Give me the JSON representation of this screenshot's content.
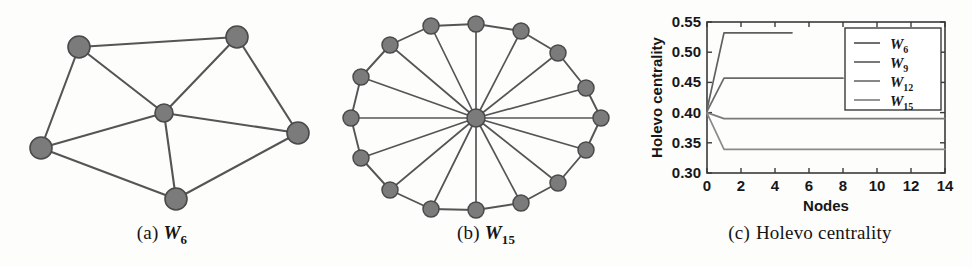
{
  "figure": {
    "panels": [
      {
        "id": "a",
        "caption_tag": "(a)",
        "caption_math": "W",
        "caption_sub": "6",
        "caption_text": "",
        "graph_name": "wheel-graph-w6"
      },
      {
        "id": "b",
        "caption_tag": "(b)",
        "caption_math": "W",
        "caption_sub": "15",
        "caption_text": "",
        "graph_name": "wheel-graph-w15"
      },
      {
        "id": "c",
        "caption_tag": "(c)",
        "caption_math": "",
        "caption_sub": "",
        "caption_text": "Holevo centrality",
        "graph_name": "holevo-centrality-chart"
      }
    ]
  },
  "colors": {
    "node_fill": "#7b7b7b",
    "node_stroke": "#4a4a4a",
    "edge": "#555555",
    "axis": "#3a3a3a",
    "line_w6": "#5f5f5f",
    "line_w9": "#6a6a6a",
    "line_w12": "#7a7a7a",
    "line_w15": "#8a8a8a",
    "background": "#fdfdfc"
  },
  "graph_w6": {
    "label": "W6",
    "node_count": 6,
    "nodes": [
      {
        "id": "n1",
        "x": 79,
        "y": 47,
        "r": 11,
        "role": "rim"
      },
      {
        "id": "n2",
        "x": 237,
        "y": 37,
        "r": 11,
        "role": "rim"
      },
      {
        "id": "n3",
        "x": 298,
        "y": 133,
        "r": 11,
        "role": "rim"
      },
      {
        "id": "n4",
        "x": 176,
        "y": 199,
        "r": 11,
        "role": "rim"
      },
      {
        "id": "n5",
        "x": 41,
        "y": 148,
        "r": 11,
        "role": "rim"
      },
      {
        "id": "hub",
        "x": 164,
        "y": 113,
        "r": 9,
        "role": "hub"
      }
    ],
    "edges": [
      [
        "n1",
        "n2"
      ],
      [
        "n2",
        "n3"
      ],
      [
        "n3",
        "n4"
      ],
      [
        "n4",
        "n5"
      ],
      [
        "n5",
        "n1"
      ],
      [
        "hub",
        "n1"
      ],
      [
        "hub",
        "n2"
      ],
      [
        "hub",
        "n3"
      ],
      [
        "hub",
        "n4"
      ],
      [
        "hub",
        "n5"
      ]
    ]
  },
  "graph_w15": {
    "label": "W15",
    "node_count": 15,
    "rim_count": 14,
    "center": {
      "x": 152,
      "y": 118,
      "r": 9
    },
    "radius_x": 125,
    "radius_y": 93,
    "rim_radius": 8,
    "start_angle_deg": 180,
    "nodes": [
      {
        "id": "r0",
        "x": 27,
        "y": 118
      },
      {
        "id": "r1",
        "x": 37,
        "y": 77
      },
      {
        "id": "r2",
        "x": 66,
        "y": 45
      },
      {
        "id": "r3",
        "x": 107,
        "y": 26
      },
      {
        "id": "r4",
        "x": 152,
        "y": 24
      },
      {
        "id": "r5",
        "x": 197,
        "y": 31
      },
      {
        "id": "r6",
        "x": 234,
        "y": 53
      },
      {
        "id": "r7",
        "x": 262,
        "y": 88
      },
      {
        "id": "r8",
        "x": 277,
        "y": 118
      },
      {
        "id": "r9",
        "x": 262,
        "y": 150
      },
      {
        "id": "r10",
        "x": 234,
        "y": 183
      },
      {
        "id": "r11",
        "x": 197,
        "y": 203
      },
      {
        "id": "r12",
        "x": 152,
        "y": 210
      },
      {
        "id": "r13",
        "x": 107,
        "y": 209
      },
      {
        "id": "r14",
        "x": 66,
        "y": 190
      },
      {
        "id": "r15",
        "x": 37,
        "y": 158
      }
    ]
  },
  "chart_data": {
    "type": "line",
    "title": "",
    "xlabel": "Nodes",
    "ylabel": "Holevo centrality",
    "xlim": [
      0,
      14
    ],
    "ylim": [
      0.3,
      0.55
    ],
    "xticks": [
      0,
      2,
      4,
      6,
      8,
      10,
      12,
      14
    ],
    "xtick_labels": [
      "0",
      "2",
      "4",
      "6",
      "8",
      "10",
      "12",
      "14"
    ],
    "yticks": [
      0.3,
      0.35,
      0.4,
      0.45,
      0.5,
      0.55
    ],
    "ytick_labels": [
      "0.30",
      "0.35",
      "0.40",
      "0.45",
      "0.50",
      "0.55"
    ],
    "grid": false,
    "legend_position": "upper right",
    "legend_entries": [
      {
        "label": "W",
        "sub": "6",
        "color": "#5f5f5f"
      },
      {
        "label": "W",
        "sub": "9",
        "color": "#6a6a6a"
      },
      {
        "label": "W",
        "sub": "12",
        "color": "#7a7a7a"
      },
      {
        "label": "W",
        "sub": "15",
        "color": "#8a8a8a"
      }
    ],
    "series": [
      {
        "name": "W6",
        "color": "#5f5f5f",
        "x": [
          0,
          1,
          2,
          3,
          4,
          5
        ],
        "values": [
          0.405,
          0.532,
          0.532,
          0.532,
          0.532,
          0.532
        ]
      },
      {
        "name": "W9",
        "color": "#6a6a6a",
        "x": [
          0,
          1,
          2,
          3,
          4,
          5,
          6,
          7,
          8
        ],
        "values": [
          0.402,
          0.457,
          0.457,
          0.457,
          0.457,
          0.457,
          0.457,
          0.457,
          0.457
        ]
      },
      {
        "name": "W12",
        "color": "#7a7a7a",
        "x": [
          0,
          1,
          2,
          3,
          4,
          5,
          6,
          7,
          8,
          9,
          10,
          11,
          12,
          13,
          14
        ],
        "values": [
          0.4,
          0.39,
          0.39,
          0.39,
          0.39,
          0.39,
          0.39,
          0.39,
          0.39,
          0.39,
          0.39,
          0.39,
          0.39,
          0.39,
          0.39
        ]
      },
      {
        "name": "W15",
        "color": "#8a8a8a",
        "x": [
          0,
          1,
          2,
          3,
          4,
          5,
          6,
          7,
          8,
          9,
          10,
          11,
          12,
          13,
          14
        ],
        "values": [
          0.399,
          0.339,
          0.339,
          0.339,
          0.339,
          0.339,
          0.339,
          0.339,
          0.339,
          0.339,
          0.339,
          0.339,
          0.339,
          0.339,
          0.339
        ]
      }
    ]
  }
}
